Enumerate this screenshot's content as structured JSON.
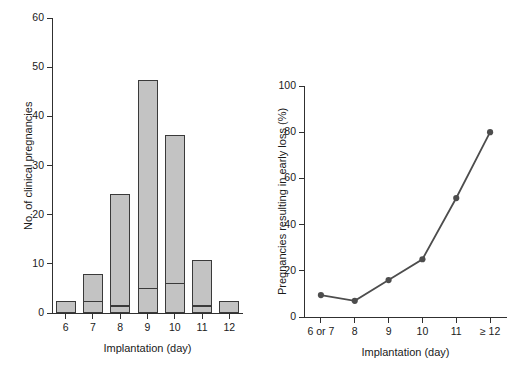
{
  "chart_data": [
    {
      "type": "bar",
      "panel": "left",
      "title": "",
      "xlabel": "Implantation (day)",
      "ylabel": "No. of clinical pregnancies",
      "categories": [
        "6",
        "7",
        "8",
        "9",
        "10",
        "11",
        "12"
      ],
      "values": [
        2.5,
        8.0,
        24.3,
        47.4,
        36.2,
        10.7,
        2.5
      ],
      "series": [
        {
          "name": "Early loss",
          "values": [
            0,
            2.4,
            1.5,
            5.0,
            6.0,
            1.5,
            0
          ]
        },
        {
          "name": "Ongoing pregnancy",
          "values": [
            2.5,
            5.6,
            22.8,
            42.4,
            30.2,
            9.2,
            2.5
          ]
        }
      ],
      "stacked": true,
      "ylim": [
        0,
        60
      ],
      "yticks": [
        "0",
        "10",
        "20",
        "30",
        "40",
        "50",
        "60"
      ],
      "ytick_values": [
        0,
        10,
        20,
        30,
        40,
        50,
        60
      ],
      "grid": false,
      "legend": "none",
      "bar_fill": "#c3c3c3",
      "bar_edge": "#3a3a3a"
    },
    {
      "type": "line",
      "panel": "right",
      "title": "",
      "xlabel": "Implantation (day)",
      "ylabel": "Pregnancies resulting in early loss (%)",
      "categories": [
        "6 or 7",
        "8",
        "9",
        "10",
        "11",
        "≥ 12"
      ],
      "values": [
        9.5,
        7.0,
        16.0,
        25.0,
        51.5,
        80.0
      ],
      "ylim": [
        0,
        100
      ],
      "yticks": [
        "0",
        "20",
        "40",
        "60",
        "80",
        "100"
      ],
      "ytick_values": [
        0,
        20,
        40,
        60,
        80,
        100
      ],
      "grid": false,
      "legend": "none",
      "marker": "circle",
      "line_color": "#4d4d4d",
      "marker_color": "#4d4d4d"
    }
  ],
  "figure": {
    "background": "#ffffff",
    "axis_color": "#303030",
    "panels": [
      {
        "id": "panel-left",
        "name": "bar-chart-panel"
      },
      {
        "id": "panel-right",
        "name": "line-chart-panel"
      }
    ]
  }
}
